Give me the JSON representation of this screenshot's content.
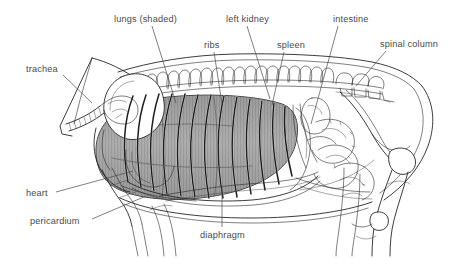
{
  "figure": {
    "background_color": "#ffffff",
    "ink_color": "#1a1a1a",
    "label_color": "#4a4a4a",
    "shading_color": "#9a9a9a"
  },
  "labels": [
    {
      "id": "trachea",
      "text": "trachea",
      "text_x": 26,
      "text_y": 72,
      "anchor": "start",
      "leader": "M 63 75 L 92 103"
    },
    {
      "id": "lungs_shaded",
      "text": "lungs (shaded)",
      "text_x": 114,
      "text_y": 22,
      "anchor": "start",
      "leader": "M 152 26 L 176 103"
    },
    {
      "id": "ribs",
      "text": "ribs",
      "text_x": 204,
      "text_y": 48,
      "anchor": "start",
      "leader": "M 214 52 L 222 104"
    },
    {
      "id": "left_kidney",
      "text": "left kidney",
      "text_x": 226,
      "text_y": 22,
      "anchor": "start",
      "leader": "M 247 26 L 270 99"
    },
    {
      "id": "spleen",
      "text": "spleen",
      "text_x": 277,
      "text_y": 48,
      "anchor": "start",
      "leader": "M 284 52 L 272 105"
    },
    {
      "id": "intestine",
      "text": "intestine",
      "text_x": 333,
      "text_y": 22,
      "anchor": "start",
      "leader": "M 338 26 L 311 124"
    },
    {
      "id": "spinal_column",
      "text": "spinal column",
      "text_x": 380,
      "text_y": 47,
      "anchor": "start",
      "leader": "M 386 51 L 356 86"
    },
    {
      "id": "heart",
      "text": "heart",
      "text_x": 26,
      "text_y": 196,
      "anchor": "start",
      "leader": "M 56 192 L 133 171"
    },
    {
      "id": "pericardium",
      "text": "pericardium",
      "text_x": 30,
      "text_y": 224,
      "anchor": "start",
      "leader": "M 92 219 L 146 196"
    },
    {
      "id": "diaphragm",
      "text": "diaphragm",
      "text_x": 200,
      "text_y": 238,
      "anchor": "start",
      "leader": "M 222 227 L 222 186"
    }
  ]
}
